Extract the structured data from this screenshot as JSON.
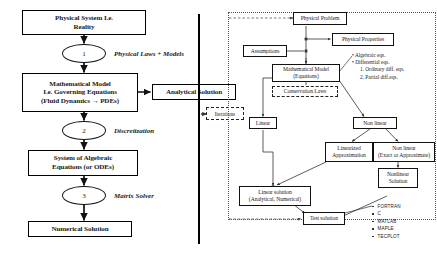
{
  "figure": {
    "panels": [
      "left-modelling-chain",
      "right-solution-tree"
    ]
  },
  "left_panel": {
    "boxes": [
      {
        "id": "physical-system",
        "label": "Physical System I.e.\nReality"
      },
      {
        "id": "mathematical-model",
        "label": "Mathematical Model\nI.e. Governing Equations\n(Fluid Dynamics → PDEs)"
      },
      {
        "id": "analytical-solution",
        "label": "Analytical Solution"
      },
      {
        "id": "system-algebraic",
        "label": "System of Algebraic\nEquations (or ODEs)"
      },
      {
        "id": "numerical-solution",
        "label": "Numerical Solution"
      }
    ],
    "steps": [
      {
        "id": "step-1",
        "number": "1",
        "caption": "Physical Laws + Models"
      },
      {
        "id": "step-2",
        "number": "2",
        "caption": "Discretization"
      },
      {
        "id": "step-3",
        "number": "3",
        "caption": "Matrix Solver"
      }
    ]
  },
  "right_panel": {
    "boxes": [
      {
        "id": "physical-problem",
        "label": "Physical Problem"
      },
      {
        "id": "physical-properties",
        "label": "Physical Properties"
      },
      {
        "id": "assumptions",
        "label": "Assumptions"
      },
      {
        "id": "mathematical-model-eq",
        "label": "Mathematical Model\n(Equations)"
      },
      {
        "id": "conservation-laws",
        "label": "Conservation Laws",
        "style": "dashed"
      },
      {
        "id": "linear",
        "label": "Linear"
      },
      {
        "id": "non-linear",
        "label": "Non linear"
      },
      {
        "id": "linearized-approximation",
        "label": "Linearized\nApproximation"
      },
      {
        "id": "non-linear-exact",
        "label": "Non linear\n(Exact or Approximate)"
      },
      {
        "id": "linear-solution",
        "label": "Linear solution\n(Analytical, Numerical)"
      },
      {
        "id": "nonlinear-solution",
        "label": "Nonlinear\nSolution"
      },
      {
        "id": "test-solution",
        "label": "Test solution"
      }
    ],
    "equation_types": [
      "• Algebraic eqs.",
      "• Differential  eqs.",
      "1. Ordinary  diff. eqs.",
      "2. Partial diff.eqs."
    ],
    "software": [
      "FORTRAN",
      "C",
      "MATLAB",
      "MAPLE",
      "TECPLOT"
    ]
  },
  "connector": {
    "iterations_label": "Iterations"
  },
  "colors": {
    "line": "#111111",
    "background": "#ffffff",
    "panel_border": "#555555",
    "divider": "#000000"
  }
}
